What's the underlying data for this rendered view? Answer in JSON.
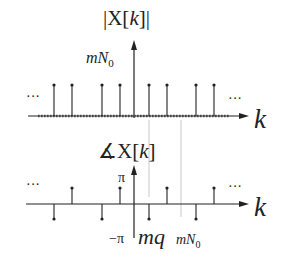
{
  "magnitude_plot": {
    "title": "|X[",
    "title_var": "k",
    "title_end": "]|",
    "peak_label_m": "mN",
    "peak_label_sub": "0",
    "ellipsis_left": "···",
    "ellipsis_right": "···",
    "axis_label": "k"
  },
  "phase_plot": {
    "title_prefix": "∡X[",
    "title_var": "k",
    "title_end": "]",
    "pi_label": "π",
    "neg_pi_label": "−π",
    "tick_label_mq": "mq",
    "tick_label_mN": "mN",
    "tick_label_mN_sub": "0",
    "ellipsis_left": "···",
    "ellipsis_right": "···",
    "axis_label": "k"
  },
  "colors": {
    "ink": "#222222",
    "faint": "#bbbbbb"
  }
}
